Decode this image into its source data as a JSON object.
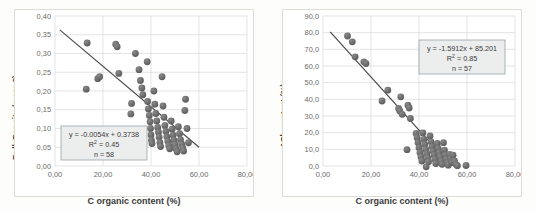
{
  "chart_data": [
    {
      "type": "scatter",
      "panel": "left",
      "title": "",
      "xlabel": "C organic content (%)",
      "ylabel": "Bulk Density (g cm-3)",
      "xlim": [
        0,
        80
      ],
      "ylim": [
        0,
        0.4
      ],
      "xticks": [
        "0,00",
        "20,00",
        "40,00",
        "60,00",
        "80,00"
      ],
      "xtick_values": [
        0,
        20,
        40,
        60,
        80
      ],
      "yticks": [
        "0,00",
        "0,05",
        "0,10",
        "0,15",
        "0,20",
        "0,25",
        "0,30",
        "0,35",
        "0,40"
      ],
      "ytick_values": [
        0,
        0.05,
        0.1,
        0.15,
        0.2,
        0.25,
        0.3,
        0.35,
        0.4
      ],
      "grid": true,
      "legend": "none",
      "annotation": {
        "equation": "y = -0.0054x + 0.3738",
        "r_squared_label": "R",
        "r_squared_sup": "2",
        "r_squared_value": "= 0.45",
        "n_label": "n = 58"
      },
      "trendline": {
        "slope": -0.0054,
        "intercept": 0.3738,
        "x_start": 2.0,
        "x_end": 60.0
      },
      "points": [
        [
          13.0,
          0.205
        ],
        [
          13.4,
          0.328
        ],
        [
          17.8,
          0.233
        ],
        [
          18.6,
          0.238
        ],
        [
          25.3,
          0.325
        ],
        [
          25.9,
          0.318
        ],
        [
          26.6,
          0.247
        ],
        [
          31.6,
          0.139
        ],
        [
          31.9,
          0.167
        ],
        [
          33.5,
          0.3
        ],
        [
          35.0,
          0.257
        ],
        [
          35.6,
          0.228
        ],
        [
          36.2,
          0.208
        ],
        [
          36.6,
          0.19
        ],
        [
          38.4,
          0.278
        ],
        [
          38.6,
          0.172
        ],
        [
          38.9,
          0.152
        ],
        [
          39.3,
          0.135
        ],
        [
          39.6,
          0.118
        ],
        [
          39.8,
          0.1
        ],
        [
          40.0,
          0.083
        ],
        [
          40.2,
          0.069
        ],
        [
          40.4,
          0.06
        ],
        [
          41.2,
          0.2
        ],
        [
          41.6,
          0.165
        ],
        [
          42.0,
          0.14
        ],
        [
          42.4,
          0.12
        ],
        [
          42.8,
          0.103
        ],
        [
          43.1,
          0.09
        ],
        [
          43.4,
          0.077
        ],
        [
          43.7,
          0.063
        ],
        [
          44.0,
          0.052
        ],
        [
          44.6,
          0.238
        ],
        [
          45.0,
          0.16
        ],
        [
          45.4,
          0.13
        ],
        [
          45.8,
          0.108
        ],
        [
          46.2,
          0.092
        ],
        [
          46.6,
          0.078
        ],
        [
          47.0,
          0.066
        ],
        [
          47.4,
          0.055
        ],
        [
          47.8,
          0.046
        ],
        [
          48.4,
          0.12
        ],
        [
          48.8,
          0.098
        ],
        [
          49.2,
          0.082
        ],
        [
          49.6,
          0.068
        ],
        [
          50.0,
          0.057
        ],
        [
          50.4,
          0.046
        ],
        [
          50.9,
          0.038
        ],
        [
          51.4,
          0.105
        ],
        [
          51.9,
          0.086
        ],
        [
          52.3,
          0.07
        ],
        [
          52.8,
          0.058
        ],
        [
          53.2,
          0.048
        ],
        [
          53.6,
          0.04
        ],
        [
          54.1,
          0.148
        ],
        [
          54.4,
          0.178
        ],
        [
          55.0,
          0.1
        ],
        [
          55.6,
          0.062
        ]
      ]
    },
    {
      "type": "scatter",
      "panel": "right",
      "title": "",
      "xlabel": "C organic content (%)",
      "ylabel": "ASh content (%)",
      "xlim": [
        0,
        80
      ],
      "ylim": [
        0,
        90
      ],
      "xticks": [
        "0,00",
        "20,00",
        "40,00",
        "60,00",
        "80,00"
      ],
      "xtick_values": [
        0,
        20,
        40,
        60,
        80
      ],
      "yticks": [
        "0,0",
        "10,0",
        "20,0",
        "30,0",
        "40,0",
        "50,0",
        "60,0",
        "70,0",
        "80,0",
        "90,0"
      ],
      "ytick_values": [
        0,
        10,
        20,
        30,
        40,
        50,
        60,
        70,
        80,
        90
      ],
      "grid": true,
      "legend": "none",
      "annotation": {
        "equation": "y = -1.5912x + 85.201",
        "r_squared_label": "R",
        "r_squared_sup": "2",
        "r_squared_value": "= 0.85",
        "n_label": "n = 57"
      },
      "trendline": {
        "slope": -1.5912,
        "intercept": 85.201,
        "x_start": 3.0,
        "x_end": 53.0
      },
      "points": [
        [
          10.2,
          78.0
        ],
        [
          12.2,
          74.5
        ],
        [
          13.4,
          65.5
        ],
        [
          17.0,
          62.5
        ],
        [
          17.9,
          61.5
        ],
        [
          24.6,
          39.0
        ],
        [
          27.0,
          45.5
        ],
        [
          31.5,
          34.5
        ],
        [
          32.0,
          33.0
        ],
        [
          32.4,
          41.5
        ],
        [
          33.0,
          31.0
        ],
        [
          35.4,
          36.5
        ],
        [
          35.9,
          34.8
        ],
        [
          36.4,
          28.5
        ],
        [
          35.0,
          9.8
        ],
        [
          38.8,
          19.5
        ],
        [
          39.2,
          17.0
        ],
        [
          39.6,
          14.0
        ],
        [
          40.0,
          11.0
        ],
        [
          40.4,
          8.0
        ],
        [
          40.8,
          5.5
        ],
        [
          41.2,
          3.0
        ],
        [
          41.6,
          19.8
        ],
        [
          42.0,
          16.0
        ],
        [
          42.4,
          13.0
        ],
        [
          42.8,
          10.0
        ],
        [
          43.2,
          7.5
        ],
        [
          43.6,
          5.0
        ],
        [
          44.0,
          2.5
        ],
        [
          43.0,
          -0.5
        ],
        [
          44.6,
          18.0
        ],
        [
          45.0,
          14.5
        ],
        [
          45.4,
          11.5
        ],
        [
          45.8,
          9.0
        ],
        [
          46.2,
          6.5
        ],
        [
          46.6,
          4.0
        ],
        [
          47.0,
          1.5
        ],
        [
          47.6,
          13.5
        ],
        [
          48.0,
          10.5
        ],
        [
          48.4,
          8.0
        ],
        [
          48.8,
          5.5
        ],
        [
          49.2,
          3.0
        ],
        [
          49.6,
          1.0
        ],
        [
          50.2,
          14.0
        ],
        [
          50.6,
          9.5
        ],
        [
          51.0,
          6.5
        ],
        [
          51.4,
          4.0
        ],
        [
          51.8,
          1.8
        ],
        [
          52.2,
          0.5
        ],
        [
          52.8,
          7.0
        ],
        [
          53.2,
          4.5
        ],
        [
          53.6,
          2.0
        ],
        [
          54.2,
          6.5
        ],
        [
          54.8,
          3.0
        ],
        [
          55.4,
          1.0
        ],
        [
          56.0,
          0.2
        ],
        [
          59.6,
          0.3
        ]
      ]
    }
  ],
  "style": {
    "marker_color": "#595959",
    "marker_highlight": "#8a8a8a",
    "trendline_color": "#4a4a4a",
    "grid_color": "#d9d9d9",
    "axis_color": "#bfbfbf",
    "tick_label_color": "#6a6a6a",
    "annotation_fill": "#eceded",
    "annotation_border": "#9aa3aa",
    "panel_background": "#fdfdfc",
    "figure_background": "#f4f4f2"
  }
}
